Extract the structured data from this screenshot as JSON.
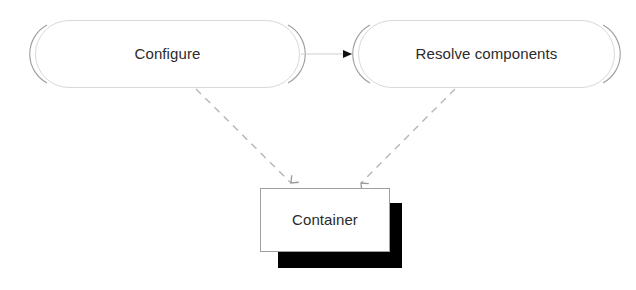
{
  "diagram": {
    "background_color": "#ffffff",
    "nodes": [
      {
        "id": "configure",
        "label": "Configure",
        "shape": "rounded-rectangle",
        "fill": "#ffffff",
        "border_color": "#b8b8b8",
        "text_color": "#2b2b2b",
        "x": 35,
        "y": 20,
        "width": 265,
        "height": 68
      },
      {
        "id": "resolve-components",
        "label": "Resolve components",
        "shape": "rounded-rectangle",
        "fill": "#ffffff",
        "border_color": "#b8b8b8",
        "text_color": "#2b2b2b",
        "x": 358,
        "y": 20,
        "width": 257,
        "height": 68
      },
      {
        "id": "container",
        "label": "Container",
        "shape": "rectangle-with-shadow",
        "fill": "#ffffff",
        "border_color": "#8a8a8a",
        "shadow_color": "#000000",
        "text_color": "#2b2b2b",
        "x": 260,
        "y": 188,
        "width": 130,
        "height": 64
      }
    ],
    "edges": [
      {
        "id": "configure-to-resolve",
        "from": "configure",
        "to": "resolve-components",
        "style": "solid",
        "arrowhead": "filled-triangle",
        "color": "#cccccc",
        "arrow_color": "#111111",
        "label": ""
      },
      {
        "id": "configure-to-container",
        "from": "configure",
        "to": "container",
        "style": "dashed",
        "arrowhead": "open-v",
        "color": "#b0b0b0",
        "label": ""
      },
      {
        "id": "resolve-to-container",
        "from": "resolve-components",
        "to": "container",
        "style": "dashed",
        "arrowhead": "open-v",
        "color": "#b0b0b0",
        "label": ""
      }
    ]
  }
}
